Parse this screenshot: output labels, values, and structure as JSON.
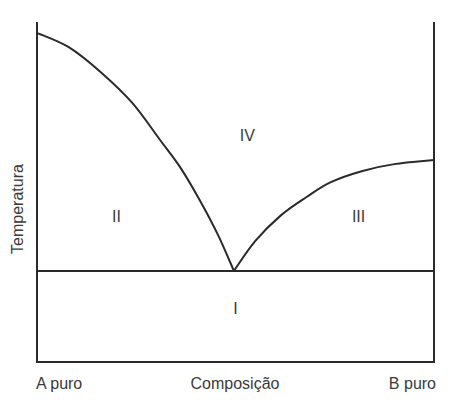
{
  "chart_data": {
    "type": "line",
    "title": "",
    "xlabel": "Composição",
    "ylabel": "Temperatura",
    "x_tick_labels": {
      "left": "A puro",
      "right": "B puro"
    },
    "xlim": [
      0,
      100
    ],
    "ylim": [
      0,
      100
    ],
    "grid": false,
    "legend": "none",
    "series": [
      {
        "name": "liquidus-A",
        "points": [
          [
            0,
            96.8
          ],
          [
            8,
            92.6
          ],
          [
            16,
            85.3
          ],
          [
            24,
            76.2
          ],
          [
            31,
            65.3
          ],
          [
            36,
            57.4
          ],
          [
            41,
            47.6
          ],
          [
            45.5,
            37.6
          ],
          [
            49.6,
            26.8
          ]
        ]
      },
      {
        "name": "liquidus-B",
        "points": [
          [
            49.6,
            26.8
          ],
          [
            55,
            35.6
          ],
          [
            61.5,
            43.2
          ],
          [
            68,
            48.6
          ],
          [
            74,
            52.9
          ],
          [
            82,
            56.2
          ],
          [
            90,
            58.2
          ],
          [
            100,
            59.4
          ]
        ]
      },
      {
        "name": "eutectic-line",
        "points": [
          [
            0,
            26.8
          ],
          [
            100,
            26.8
          ]
        ]
      }
    ],
    "annotations": [
      {
        "text": "IV",
        "x": 53,
        "y": 66.8
      },
      {
        "text": "II",
        "x": 20,
        "y": 42.9
      },
      {
        "text": "III",
        "x": 81,
        "y": 42.9
      },
      {
        "text": "I",
        "x": 50,
        "y": 15.9
      }
    ]
  }
}
